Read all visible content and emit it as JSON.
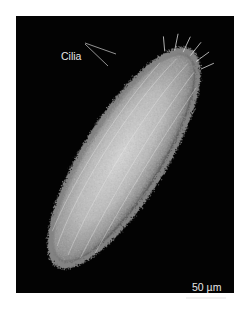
{
  "figure": {
    "background_color": "#030303",
    "page_color": "#ffffff",
    "cell_color": "#cfcfcf"
  },
  "labels": {
    "cilia": "Cilia",
    "scale_bar": "50 µm"
  }
}
